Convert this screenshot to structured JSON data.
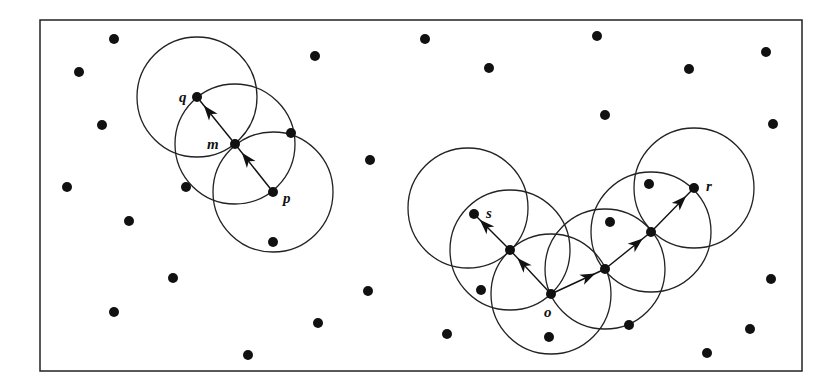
{
  "diagram": {
    "frame": {
      "x": 40,
      "y": 20,
      "width": 762,
      "height": 351
    },
    "colors": {
      "stroke": "#222222",
      "point": "#111111",
      "background": "#ffffff"
    },
    "radius": 60,
    "labels": [
      {
        "id": "q",
        "text": "q",
        "x": 179,
        "y": 102
      },
      {
        "id": "m",
        "text": "m",
        "x": 207,
        "y": 149
      },
      {
        "id": "p",
        "text": "p",
        "x": 283,
        "y": 203
      },
      {
        "id": "s",
        "text": "s",
        "x": 486,
        "y": 218
      },
      {
        "id": "o",
        "text": "o",
        "x": 544,
        "y": 317
      },
      {
        "id": "r",
        "text": "r",
        "x": 706,
        "y": 191
      }
    ],
    "core_points": [
      {
        "name": "q",
        "x": 197,
        "y": 97
      },
      {
        "name": "m",
        "x": 235,
        "y": 144
      },
      {
        "name": "p",
        "x": 273,
        "y": 192
      },
      {
        "name": "s",
        "x": 474,
        "y": 214
      },
      {
        "name": "n1",
        "x": 510,
        "y": 250
      },
      {
        "name": "o",
        "x": 551,
        "y": 294
      },
      {
        "name": "n2",
        "x": 605,
        "y": 269
      },
      {
        "name": "n3",
        "x": 651,
        "y": 232
      },
      {
        "name": "r",
        "x": 694,
        "y": 188
      }
    ],
    "circles": [
      {
        "cx": 197,
        "cy": 97
      },
      {
        "cx": 235,
        "cy": 144
      },
      {
        "cx": 273,
        "cy": 192
      },
      {
        "cx": 468,
        "cy": 208
      },
      {
        "cx": 510,
        "cy": 250
      },
      {
        "cx": 551,
        "cy": 294
      },
      {
        "cx": 605,
        "cy": 269
      },
      {
        "cx": 651,
        "cy": 232
      },
      {
        "cx": 694,
        "cy": 188
      }
    ],
    "arrows": [
      {
        "from": [
          273,
          192
        ],
        "to": [
          235,
          144
        ]
      },
      {
        "from": [
          235,
          144
        ],
        "to": [
          197,
          97
        ]
      },
      {
        "from": [
          551,
          294
        ],
        "to": [
          510,
          250
        ]
      },
      {
        "from": [
          510,
          250
        ],
        "to": [
          474,
          214
        ]
      },
      {
        "from": [
          551,
          294
        ],
        "to": [
          605,
          269
        ]
      },
      {
        "from": [
          605,
          269
        ],
        "to": [
          651,
          232
        ]
      },
      {
        "from": [
          651,
          232
        ],
        "to": [
          694,
          188
        ]
      }
    ],
    "other_points": [
      [
        114,
        39
      ],
      [
        79,
        72
      ],
      [
        102,
        125
      ],
      [
        67,
        187
      ],
      [
        315,
        56
      ],
      [
        370,
        160
      ],
      [
        291,
        133
      ],
      [
        186,
        187
      ],
      [
        129,
        221
      ],
      [
        273,
        242
      ],
      [
        173,
        278
      ],
      [
        114,
        312
      ],
      [
        318,
        323
      ],
      [
        248,
        355
      ],
      [
        368,
        291
      ],
      [
        425,
        39
      ],
      [
        489,
        68
      ],
      [
        597,
        36
      ],
      [
        605,
        115
      ],
      [
        689,
        69
      ],
      [
        766,
        52
      ],
      [
        773,
        124
      ],
      [
        649,
        184
      ],
      [
        610,
        222
      ],
      [
        481,
        290
      ],
      [
        447,
        334
      ],
      [
        549,
        337
      ],
      [
        629,
        325
      ],
      [
        771,
        279
      ],
      [
        750,
        329
      ],
      [
        707,
        353
      ]
    ]
  }
}
